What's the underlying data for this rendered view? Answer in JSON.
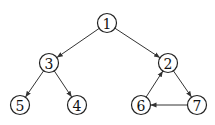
{
  "diagram": {
    "type": "directed-graph",
    "nodes": [
      {
        "id": "1",
        "label": "1",
        "x": 107,
        "y": 23
      },
      {
        "id": "3",
        "label": "3",
        "x": 49,
        "y": 63
      },
      {
        "id": "2",
        "label": "2",
        "x": 168,
        "y": 63
      },
      {
        "id": "5",
        "label": "5",
        "x": 20,
        "y": 105
      },
      {
        "id": "4",
        "label": "4",
        "x": 77,
        "y": 105
      },
      {
        "id": "6",
        "label": "6",
        "x": 141,
        "y": 105
      },
      {
        "id": "7",
        "label": "7",
        "x": 197,
        "y": 105
      }
    ],
    "edges": [
      {
        "from": "1",
        "to": "3"
      },
      {
        "from": "1",
        "to": "2"
      },
      {
        "from": "3",
        "to": "5"
      },
      {
        "from": "3",
        "to": "4"
      },
      {
        "from": "2",
        "to": "7"
      },
      {
        "from": "7",
        "to": "6"
      },
      {
        "from": "6",
        "to": "2"
      }
    ]
  }
}
